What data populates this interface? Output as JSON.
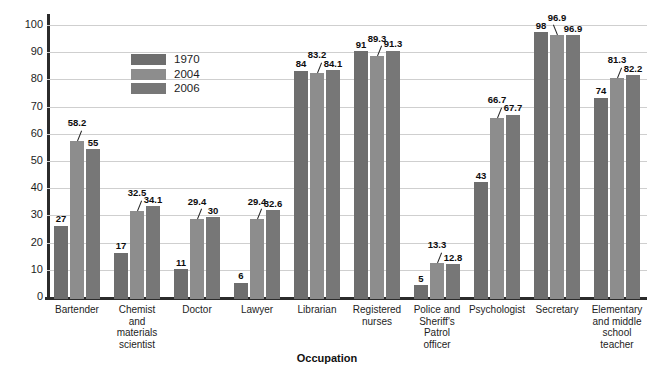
{
  "chart_data": {
    "type": "bar",
    "title": "",
    "xlabel": "Occupation",
    "ylabel": "Percentage",
    "ylim": [
      0,
      100
    ],
    "yticks": [
      0,
      10,
      20,
      30,
      40,
      50,
      60,
      70,
      80,
      90,
      100
    ],
    "grid": true,
    "legend_position": "upper-left-inside",
    "categories": [
      "Bartender",
      "Chemist and materials scientist",
      "Doctor",
      "Lawyer",
      "Librarian",
      "Registered nurses",
      "Police and Sheriff's Patrol officer",
      "Psychologist",
      "Secretary",
      "Elementary and middle school teacher"
    ],
    "category_lines": [
      [
        "Bartender"
      ],
      [
        "Chemist",
        "and materials",
        "scientist"
      ],
      [
        "Doctor"
      ],
      [
        "Lawyer"
      ],
      [
        "Librarian"
      ],
      [
        "Registered",
        "nurses"
      ],
      [
        "Police and",
        "Sheriff's",
        "Patrol",
        "officer"
      ],
      [
        "Psychologist"
      ],
      [
        "Secretary"
      ],
      [
        "Elementary",
        "and middle",
        "school",
        "teacher"
      ]
    ],
    "series": [
      {
        "name": "1970",
        "color": "#6e6e6e",
        "values": [
          27,
          17,
          11,
          6,
          84,
          91,
          5,
          43,
          98,
          74
        ],
        "labels": [
          "27",
          "17",
          "11",
          "6",
          "84",
          "91",
          "5",
          "43",
          "98",
          "74"
        ]
      },
      {
        "name": "2004",
        "color": "#8d8d8d",
        "values": [
          58.2,
          32.5,
          29.4,
          29.4,
          83.2,
          89.3,
          13.3,
          66.7,
          96.9,
          81.3
        ],
        "labels": [
          "58.2",
          "32.5",
          "29.4",
          "29.4",
          "83.2",
          "89.3",
          "13.3",
          "66.7",
          "96.9",
          "81.3"
        ]
      },
      {
        "name": "2006",
        "color": "#777777",
        "values": [
          55,
          34.1,
          30,
          32.6,
          84.1,
          91.3,
          12.8,
          67.7,
          96.9,
          82.2
        ],
        "labels": [
          "55",
          "34.1",
          "30",
          "32.6",
          "84.1",
          "91.3",
          "12.8",
          "67.7",
          "96.9",
          "82.2"
        ]
      }
    ]
  },
  "legend": {
    "items": [
      {
        "label": "1970",
        "color": "#6e6e6e"
      },
      {
        "label": "2004",
        "color": "#8d8d8d"
      },
      {
        "label": "2006",
        "color": "#777777"
      }
    ]
  },
  "axis": {
    "y_title": "Percentage",
    "x_title": "Occupation"
  }
}
